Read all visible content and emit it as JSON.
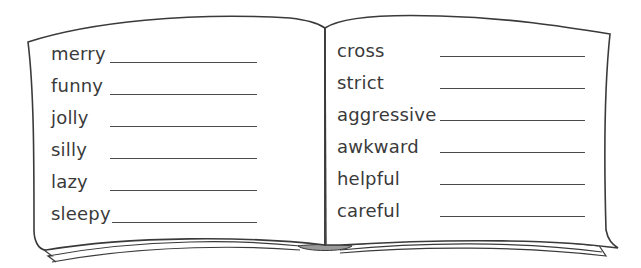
{
  "worksheet": {
    "left_page": {
      "words": [
        "merry",
        "funny",
        "jolly",
        "silly",
        "lazy",
        "sleepy"
      ]
    },
    "right_page": {
      "words": [
        "cross",
        "strict",
        "aggressive",
        "awkward",
        "helpful",
        "careful"
      ]
    }
  },
  "colors": {
    "outline": "#3a3a3a",
    "text": "#3a3a3a",
    "spine_fill": "#9a9a9a"
  }
}
